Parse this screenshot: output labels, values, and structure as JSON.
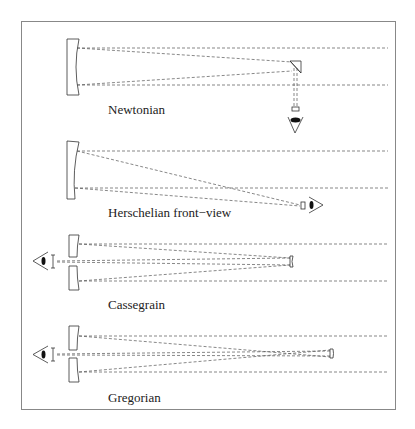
{
  "diagram": {
    "panels": [
      {
        "id": "newtonian",
        "label": "Newtonian"
      },
      {
        "id": "herschelian",
        "label": "Herschelian front−view"
      },
      {
        "id": "cassegrain",
        "label": "Cassegrain"
      },
      {
        "id": "gregorian",
        "label": "Gregorian"
      }
    ]
  }
}
